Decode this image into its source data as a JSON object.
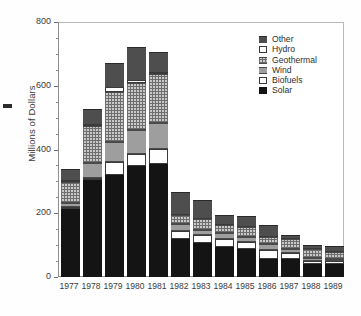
{
  "chart_data": {
    "type": "bar",
    "subtype": "stacked-bar",
    "title": "",
    "xlabel": "",
    "ylabel": "Millions of Dollars",
    "ylim": [
      0,
      800
    ],
    "yticks": [
      0,
      200,
      400,
      600,
      800
    ],
    "ytick_labels": [
      "0",
      "200",
      "400",
      "600",
      "800"
    ],
    "yminor_ticks": [
      50,
      100,
      150,
      250,
      300,
      350,
      450,
      500,
      550,
      650,
      700,
      750
    ],
    "grid": false,
    "legend_position": "top-right",
    "categories": [
      "1977",
      "1978",
      "1979",
      "1980",
      "1981",
      "1982",
      "1983",
      "1984",
      "1985",
      "1986",
      "1987",
      "1988",
      "1989"
    ],
    "series": [
      {
        "name": "Solar",
        "color": "#141414",
        "pattern": "solid-black",
        "values": [
          213,
          305,
          320,
          348,
          355,
          118,
          108,
          95,
          87,
          57,
          56,
          41,
          41
        ]
      },
      {
        "name": "Biofuels",
        "color": "#fefefe",
        "pattern": "solid-white",
        "values": [
          8,
          5,
          42,
          38,
          48,
          26,
          25,
          25,
          22,
          28,
          20,
          10,
          8
        ]
      },
      {
        "name": "Wind",
        "color": "#9e9e9e",
        "pattern": "solid-gray",
        "values": [
          10,
          48,
          62,
          74,
          80,
          22,
          16,
          18,
          16,
          20,
          12,
          9,
          8
        ]
      },
      {
        "name": "Geothermal",
        "color": "#c9c9c9",
        "pattern": "cross-hatch",
        "values": [
          68,
          117,
          158,
          148,
          155,
          28,
          34,
          26,
          32,
          20,
          32,
          28,
          22
        ]
      },
      {
        "name": "Hydro",
        "color": "#fcfcfc",
        "pattern": "solid-white",
        "values": [
          4,
          4,
          14,
          10,
          4,
          3,
          3,
          3,
          3,
          3,
          3,
          3,
          3
        ]
      },
      {
        "name": "Other",
        "color": "#4e4e4e",
        "pattern": "solid-darkgray",
        "values": [
          35,
          49,
          74,
          105,
          63,
          70,
          56,
          27,
          31,
          34,
          10,
          8,
          14
        ]
      }
    ],
    "totals": [
      338,
      528,
      670,
      723,
      705,
      267,
      242,
      194,
      191,
      162,
      133,
      99,
      96
    ]
  },
  "legend": {
    "items": [
      {
        "label": "Other",
        "swatch": "legend-swatch-other"
      },
      {
        "label": "Hydro",
        "swatch": "legend-swatch-hydro"
      },
      {
        "label": "Geothermal",
        "swatch": "legend-swatch-geothermal"
      },
      {
        "label": "Wind",
        "swatch": "legend-swatch-wind"
      },
      {
        "label": "Biofuels",
        "swatch": "legend-swatch-biofuels"
      },
      {
        "label": "Solar",
        "swatch": "legend-swatch-solar"
      }
    ]
  }
}
